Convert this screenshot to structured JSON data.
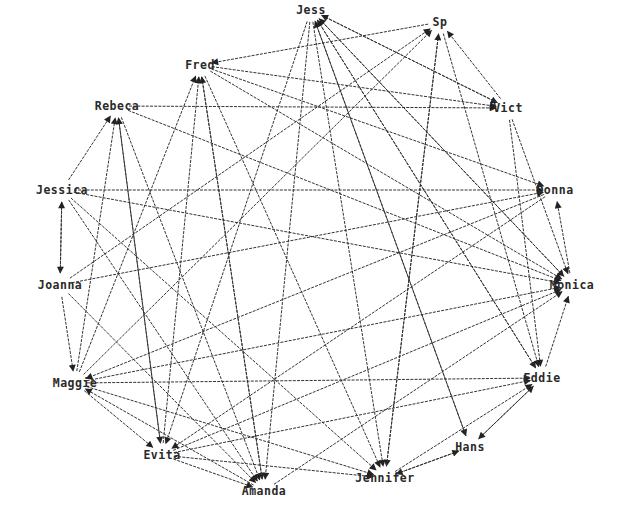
{
  "graph": {
    "type": "directed-network",
    "layout": "circular",
    "nodes": [
      {
        "id": "jess",
        "label": "Jess",
        "x": 311,
        "y": 10
      },
      {
        "id": "sp",
        "label": "Sp",
        "x": 440,
        "y": 22
      },
      {
        "id": "fred",
        "label": "Fred",
        "x": 200,
        "y": 65
      },
      {
        "id": "vict",
        "label": "Vict",
        "x": 508,
        "y": 108
      },
      {
        "id": "rebeca",
        "label": "Rebeca",
        "x": 117,
        "y": 106
      },
      {
        "id": "donna",
        "label": "Donna",
        "x": 555,
        "y": 190
      },
      {
        "id": "jessica",
        "label": "Jessica",
        "x": 62,
        "y": 190
      },
      {
        "id": "joanna",
        "label": "Joanna",
        "x": 60,
        "y": 285
      },
      {
        "id": "monica",
        "label": "Monica",
        "x": 572,
        "y": 285
      },
      {
        "id": "maggie",
        "label": "Maggie",
        "x": 75,
        "y": 383
      },
      {
        "id": "eddie",
        "label": "Eddie",
        "x": 542,
        "y": 378
      },
      {
        "id": "hans",
        "label": "Hans",
        "x": 470,
        "y": 447
      },
      {
        "id": "evita",
        "label": "Evita",
        "x": 162,
        "y": 455
      },
      {
        "id": "jennifer",
        "label": "Jennifer",
        "x": 385,
        "y": 478
      },
      {
        "id": "amanda",
        "label": "Amanda",
        "x": 264,
        "y": 491
      }
    ],
    "edges": [
      [
        "sp",
        "fred"
      ],
      [
        "jess",
        "vict"
      ],
      [
        "fred",
        "vict"
      ],
      [
        "rebeca",
        "vict"
      ],
      [
        "jess",
        "amanda"
      ],
      [
        "jess",
        "jennifer"
      ],
      [
        "jess",
        "hans"
      ],
      [
        "jess",
        "eddie"
      ],
      [
        "jess",
        "monica"
      ],
      [
        "jess",
        "evita"
      ],
      [
        "vict",
        "sp"
      ],
      [
        "vict",
        "jess"
      ],
      [
        "vict",
        "eddie"
      ],
      [
        "vict",
        "monica"
      ],
      [
        "sp",
        "jennifer"
      ],
      [
        "sp",
        "eddie"
      ],
      [
        "maggie",
        "sp"
      ],
      [
        "joanna",
        "sp"
      ],
      [
        "fred",
        "amanda"
      ],
      [
        "fred",
        "jennifer"
      ],
      [
        "fred",
        "monica"
      ],
      [
        "fred",
        "donna"
      ],
      [
        "evita",
        "fred"
      ],
      [
        "maggie",
        "fred"
      ],
      [
        "rebeca",
        "monica"
      ],
      [
        "rebeca",
        "evita"
      ],
      [
        "rebeca",
        "amanda"
      ],
      [
        "jessica",
        "rebeca"
      ],
      [
        "maggie",
        "rebeca"
      ],
      [
        "evita",
        "rebeca"
      ],
      [
        "jessica",
        "donna"
      ],
      [
        "jessica",
        "monica"
      ],
      [
        "jessica",
        "joanna"
      ],
      [
        "joanna",
        "jessica"
      ],
      [
        "jessica",
        "amanda"
      ],
      [
        "jessica",
        "jennifer"
      ],
      [
        "joanna",
        "donna"
      ],
      [
        "joanna",
        "maggie"
      ],
      [
        "joanna",
        "amanda"
      ],
      [
        "maggie",
        "eddie"
      ],
      [
        "maggie",
        "monica"
      ],
      [
        "maggie",
        "evita"
      ],
      [
        "maggie",
        "jennifer"
      ],
      [
        "evita",
        "monica"
      ],
      [
        "evita",
        "eddie"
      ],
      [
        "evita",
        "jennifer"
      ],
      [
        "evita",
        "amanda"
      ],
      [
        "amanda",
        "monica"
      ],
      [
        "amanda",
        "fred"
      ],
      [
        "amanda",
        "maggie"
      ],
      [
        "jennifer",
        "sp"
      ],
      [
        "jennifer",
        "eddie"
      ],
      [
        "hans",
        "jennifer"
      ],
      [
        "jennifer",
        "hans"
      ],
      [
        "hans",
        "eddie"
      ],
      [
        "eddie",
        "hans"
      ],
      [
        "eddie",
        "monica"
      ],
      [
        "monica",
        "donna"
      ],
      [
        "donna",
        "maggie"
      ],
      [
        "donna",
        "evita"
      ],
      [
        "hans",
        "jess"
      ],
      [
        "eddie",
        "jess"
      ],
      [
        "monica",
        "jess"
      ]
    ],
    "colors": {
      "edge": "#333333",
      "label": "#2a2a2a",
      "background": "#ffffff"
    }
  }
}
